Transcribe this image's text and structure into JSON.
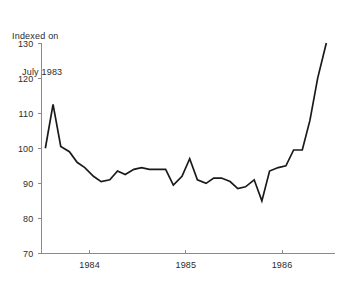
{
  "chart_data": {
    "type": "line",
    "title": "Indexed on July 1983",
    "title_line_1": "Indexed on",
    "title_line_2": "July 1983",
    "xlabel": "",
    "ylabel": "",
    "ylim": [
      70,
      130
    ],
    "y_ticks": [
      70,
      80,
      90,
      100,
      110,
      120,
      130
    ],
    "y_tick_labels": [
      "70",
      "80",
      "90",
      "100",
      "110",
      "120",
      "130"
    ],
    "x_ticks": [
      1984,
      1985,
      1986
    ],
    "x_tick_labels": [
      "1984",
      "1985",
      "1986"
    ],
    "xlim": [
      1983.5,
      1986.55
    ],
    "grid": false,
    "legend": null,
    "line_color": "#1a1a1a",
    "axis_color": "#8a8a8a",
    "series": [
      {
        "name": "Index",
        "x": [
          1983.54,
          1983.62,
          1983.7,
          1983.79,
          1983.87,
          1983.95,
          1984.04,
          1984.12,
          1984.21,
          1984.29,
          1984.37,
          1984.46,
          1984.54,
          1984.62,
          1984.71,
          1984.79,
          1984.87,
          1984.96,
          1985.04,
          1985.12,
          1985.21,
          1985.29,
          1985.37,
          1985.46,
          1985.54,
          1985.62,
          1985.71,
          1985.79,
          1985.87,
          1985.96,
          1986.04,
          1986.12,
          1986.21,
          1986.29,
          1986.37,
          1986.46
        ],
        "values": [
          100.0,
          112.5,
          100.5,
          99.0,
          96.0,
          94.5,
          92.0,
          90.5,
          91.0,
          93.5,
          92.5,
          94.0,
          94.5,
          94.0,
          94.0,
          94.0,
          89.5,
          92.0,
          97.0,
          91.0,
          90.0,
          91.5,
          91.5,
          90.5,
          88.5,
          89.0,
          91.0,
          85.0,
          93.5,
          94.5,
          95.0,
          99.5,
          99.5,
          108.0,
          120.0,
          130.0
        ]
      }
    ]
  }
}
